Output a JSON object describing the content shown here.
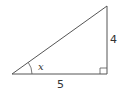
{
  "diagram": {
    "type": "right-triangle",
    "labels": {
      "vertical_side": "4",
      "horizontal_side": "5",
      "angle": "x"
    },
    "stroke_color": "#555555"
  }
}
